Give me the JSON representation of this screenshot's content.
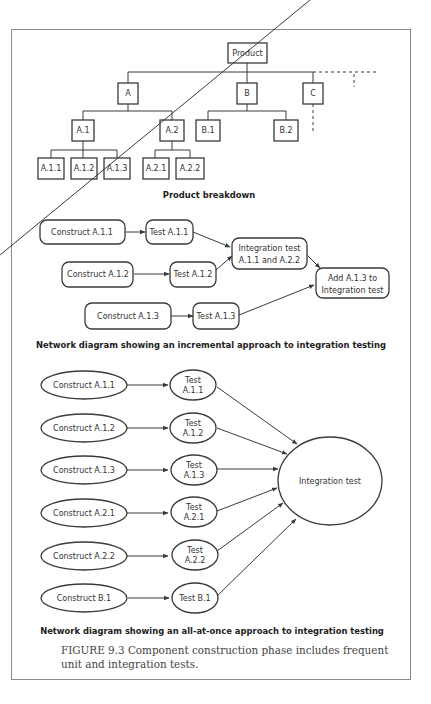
{
  "figure": {
    "caption": "FIGURE 9.3 Component construction phase includes frequent unit and integration tests."
  },
  "product_breakdown": {
    "title": "Product breakdown",
    "nodes": {
      "root": "Product",
      "a": "A",
      "b": "B",
      "c": "C",
      "a1": "A.1",
      "a2": "A.2",
      "b1": "B.1",
      "b2": "B.2",
      "a11": "A.1.1",
      "a12": "A.1.2",
      "a13": "A.1.3",
      "a21": "A.2.1",
      "a22": "A.2.2"
    }
  },
  "incremental": {
    "title": "Network diagram showing an incremental approach to integration testing",
    "construct": [
      "Construct A.1.1",
      "Construct A.1.2",
      "Construct A.1.3"
    ],
    "test": [
      "Test A.1.1",
      "Test A.1.2",
      "Test A.1.3"
    ],
    "integration_line1": "Integration test",
    "integration_line2": "A.1.1 and A.2.2",
    "add_line1": "Add A.1.3 to",
    "add_line2": "Integration test"
  },
  "all_at_once": {
    "title": "Network diagram showing an all-at-once approach to integration testing",
    "construct": [
      "Construct A.1.1",
      "Construct A.1.2",
      "Construct A.1.3",
      "Construct A.2.1",
      "Construct A.2.2",
      "Construct B.1"
    ],
    "test_line1": [
      "Test",
      "Test",
      "Test",
      "Test",
      "Test",
      "Test B.1"
    ],
    "test_line2": [
      "A.1.1",
      "A.1.2",
      "A.1.3",
      "A.2.1",
      "A.2.2",
      ""
    ],
    "integration": "Integration test"
  }
}
